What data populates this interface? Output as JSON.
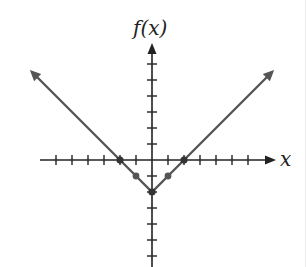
{
  "chart_data": {
    "type": "line",
    "title": "",
    "function": "f(x) = |x| - 2",
    "xlabel": "x",
    "ylabel": "f(x)",
    "xlim": [
      -7.5,
      7.5
    ],
    "ylim": [
      -6.5,
      7
    ],
    "x_ticks": [
      -6,
      -5,
      -4,
      -3,
      -2,
      -1,
      1,
      2,
      3,
      4,
      5,
      6
    ],
    "y_ticks": [
      -6,
      -5,
      -4,
      -3,
      -2,
      -1,
      1,
      2,
      3,
      4,
      5,
      6
    ],
    "grid": false,
    "tick_labels_shown": false,
    "series": [
      {
        "name": "f(x)",
        "x": [
          -7.5,
          -2,
          -1,
          0,
          1,
          2,
          7.5
        ],
        "y": [
          5.5,
          0,
          -1,
          -2,
          -1,
          0,
          5.5
        ],
        "color": "#555555",
        "arrows_at_ends": true
      }
    ],
    "marked_points": [
      {
        "x": -2,
        "y": 0
      },
      {
        "x": -1,
        "y": -1
      },
      {
        "x": 0,
        "y": -2
      },
      {
        "x": 1,
        "y": -1
      },
      {
        "x": 2,
        "y": 0
      }
    ]
  },
  "labels": {
    "y_axis": "f(x)",
    "x_axis": "x"
  },
  "colors": {
    "axis": "#222222",
    "line": "#555555",
    "point": "#333333"
  }
}
